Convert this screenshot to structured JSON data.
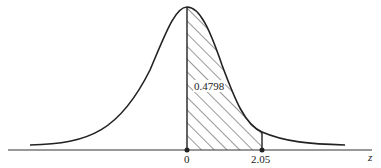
{
  "figure": {
    "type": "normal distribution curve",
    "shaded_area_label": "0.4798",
    "axis_variable": "z",
    "tick_labels": [
      "0",
      "2.05"
    ],
    "shaded_region": {
      "from": "0",
      "to": "2.05"
    }
  }
}
